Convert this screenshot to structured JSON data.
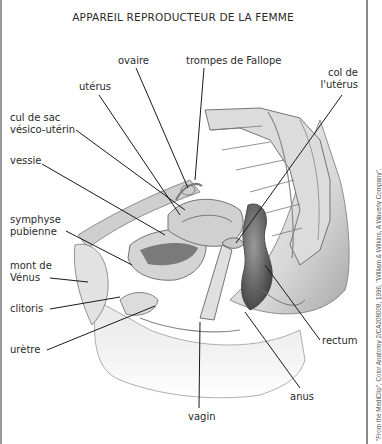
{
  "title": "APPAREIL REPRODUCTEUR DE LA FEMME",
  "labels": {
    "ovaire": "ovaire",
    "trompes": "trompes de Fallope",
    "uterus": "utérus",
    "col_line1": "col de",
    "col_line2": "l'utérus",
    "culdesac_line1": "cul de sac",
    "culdesac_line2": "vésico-utérin",
    "vessie": "vessie",
    "symphyse_line1": "symphyse",
    "symphyse_line2": "pubienne",
    "mont_line1": "mont de",
    "mont_line2": "Vénus",
    "clitoris": "clitoris",
    "uretre": "urètre",
    "rectum": "rectum",
    "anus": "anus",
    "vagin": "vagin"
  },
  "credit": "\"From the MediClip\", Color Anatomy 2/CA208008, 1996, \"William & Wilkins, A Waverly Company\".",
  "colors": {
    "line": "#1a1a1a",
    "tissue_light": "#e6e6e6",
    "tissue_mid": "#bdbdbd",
    "tissue_dark": "#6e6e6e",
    "border": "#8a8a8a"
  }
}
